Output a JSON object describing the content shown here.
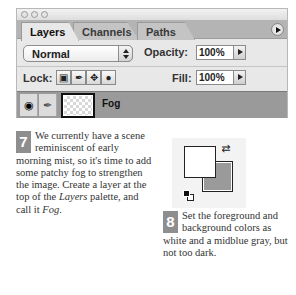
{
  "palette": {
    "tabs": [
      {
        "label": "Layers",
        "active": true
      },
      {
        "label": "Channels",
        "active": false
      },
      {
        "label": "Paths",
        "active": false
      }
    ],
    "menu_icon": "palette-menu-arrow-icon",
    "blend_mode": "Normal",
    "opacity_label": "Opacity:",
    "opacity_value": "100%",
    "lock_label": "Lock:",
    "lock_icons": [
      "lock-transparent-pixels-icon",
      "lock-image-pixels-icon",
      "lock-position-icon",
      "lock-all-icon"
    ],
    "fill_label": "Fill:",
    "fill_value": "100%",
    "layer": {
      "name": "Fog",
      "visible_icon": "eye-icon",
      "brush_icon": "paintbrush-icon",
      "thumbnail": "transparent-checkerboard"
    }
  },
  "steps": [
    {
      "number": "7",
      "text_before": "We currently have a scene reminiscent of early morning mist, so it's time to add some patchy fog to strengthen the image. Create a layer at the top of the ",
      "italic1": "Layers",
      "text_middle": " palette, and call it ",
      "italic2": "Fog",
      "text_after": "."
    },
    {
      "number": "8",
      "text": "Set the foreground and background colors as white and a midblue gray, but not too dark."
    }
  ],
  "colors": {
    "foreground": "#ffffff",
    "background": "#9a9a9a",
    "badge": "#8e8e8e"
  }
}
